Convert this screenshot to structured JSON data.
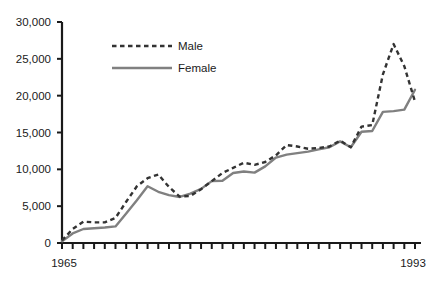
{
  "chart_data": {
    "type": "line",
    "title": "",
    "subtitle": "",
    "xlabel": "",
    "ylabel": "",
    "x": [
      1965,
      1966,
      1967,
      1968,
      1969,
      1970,
      1971,
      1972,
      1973,
      1974,
      1975,
      1976,
      1977,
      1978,
      1979,
      1980,
      1981,
      1982,
      1983,
      1984,
      1985,
      1986,
      1987,
      1988,
      1989,
      1990,
      1991,
      1992,
      1993
    ],
    "xlim": [
      1965,
      1993
    ],
    "ylim": [
      0,
      30000
    ],
    "grid": false,
    "legend_position": "upper-left-inside",
    "y_tick_values": [
      0,
      5000,
      10000,
      15000,
      20000,
      25000,
      30000
    ],
    "y_tick_labels": [
      "0",
      "5,000",
      "10,000",
      "15,000",
      "20,000",
      "25,000",
      "30,000"
    ],
    "x_tick_labels": [
      "1965",
      "1993"
    ],
    "x_tick_label_values": [
      1965,
      1993
    ],
    "x_tick_count": 29,
    "series": [
      {
        "name": "Male",
        "style": "dashed",
        "color": "#333333",
        "values": [
          350,
          1900,
          2900,
          2800,
          2800,
          3400,
          5600,
          7700,
          8800,
          9300,
          7600,
          6300,
          6400,
          7300,
          8400,
          9500,
          10200,
          10900,
          10600,
          11000,
          11900,
          13300,
          13100,
          12800,
          12900,
          13100,
          13900,
          13000,
          15800
        ]
      },
      {
        "name": "Female",
        "style": "solid",
        "color": "#808080",
        "values": [
          250,
          1300,
          1900,
          2000,
          2100,
          2250,
          4000,
          5800,
          7700,
          6950,
          6500,
          6250,
          6700,
          7350,
          8400,
          8450,
          9500,
          9700,
          9550,
          10400,
          11600,
          12000,
          12200,
          12400,
          12700,
          13000,
          13800,
          13000,
          15100
        ]
      }
    ],
    "series_extension_note": {
      "Male": [
        15800,
        16000,
        22900,
        27000,
        24000,
        19200
      ],
      "Female": [
        15100,
        15200,
        17800,
        17900,
        18100,
        20800
      ]
    }
  },
  "legend": {
    "entries": [
      {
        "label": "Male",
        "style": "dashed",
        "color": "#333333"
      },
      {
        "label": "Female",
        "style": "solid",
        "color": "#808080"
      }
    ]
  },
  "axis": {
    "y_labels": [
      "30,000",
      "25,000",
      "20,000",
      "15,000",
      "10,000",
      "5,000",
      "0"
    ],
    "x_start_label": "1965",
    "x_end_label": "1993"
  }
}
